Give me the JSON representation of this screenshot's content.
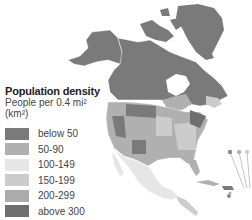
{
  "legend": {
    "title": "Population density",
    "subtitle_line1": "People per 0.4 mi²",
    "subtitle_line2": "(km²)",
    "items": [
      {
        "label": "below 50",
        "color": "#7a7a7a"
      },
      {
        "label": "50-90",
        "color": "#b0b0b0"
      },
      {
        "label": "100-149",
        "color": "#e6e6e6"
      },
      {
        "label": "150-199",
        "color": "#cccccc"
      },
      {
        "label": "200-299",
        "color": "#ababab"
      },
      {
        "label": "above 300",
        "color": "#6e6e6e"
      }
    ]
  },
  "map": {
    "region": "North America",
    "callout_dots": [
      "#8a8a8a",
      "#b5b5b5",
      "#cfcfcf"
    ]
  }
}
